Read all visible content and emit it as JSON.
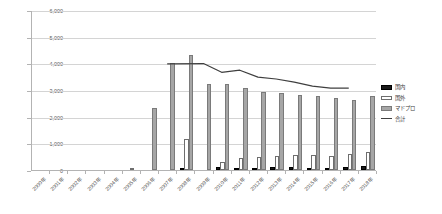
{
  "chart_data": {
    "type": "bar",
    "title": "",
    "subtitle": "",
    "xlabel": "",
    "ylabel": "",
    "ylim": [
      0,
      6000
    ],
    "ytick_step": 1000,
    "ytick_labels": [
      "6,000",
      "5,000",
      "4,000",
      "3,000",
      "2,000",
      "1,000",
      "0"
    ],
    "ytick_values": [
      6000,
      5000,
      4000,
      3000,
      2000,
      1000,
      0
    ],
    "grid": true,
    "legend_position": "right",
    "categories": [
      "2000年",
      "2001年",
      "2002年",
      "2003年",
      "2004年",
      "2005年",
      "2006年",
      "2007年",
      "2008年",
      "2009年",
      "2010年",
      "2011年",
      "2012年",
      "2013年",
      "2014年",
      "2015年",
      "2016年",
      "2017年",
      "2018年"
    ],
    "series": [
      {
        "name": "国内",
        "kind": "bar",
        "color": "#1a1a1a",
        "values": [
          0,
          0,
          0,
          0,
          0,
          0,
          0,
          0,
          90,
          0,
          95,
          85,
          90,
          95,
          95,
          90,
          90,
          100,
          150
        ]
      },
      {
        "name": "国外",
        "kind": "bar",
        "color": "#ffffff",
        "values": [
          0,
          0,
          0,
          0,
          0,
          20,
          0,
          0,
          1180,
          0,
          290,
          460,
          480,
          520,
          560,
          560,
          540,
          600,
          680
        ]
      },
      {
        "name": "マドプロ",
        "kind": "bar",
        "color": "#a6a6a6",
        "values": [
          0,
          0,
          0,
          0,
          0,
          0,
          2330,
          4030,
          4300,
          3240,
          3210,
          3060,
          2920,
          2870,
          2800,
          2760,
          2700,
          2620,
          2790
        ]
      },
      {
        "name": "合計",
        "kind": "line",
        "color": "#3f3f3f",
        "values": [
          null,
          null,
          null,
          null,
          null,
          null,
          null,
          4020,
          null,
          4030,
          3700,
          3780,
          3520,
          3450,
          3330,
          3180,
          3110,
          3110,
          null
        ]
      }
    ],
    "legend_entries": [
      {
        "label": "国内",
        "swatch": "s-domestic"
      },
      {
        "label": "国外",
        "swatch": "s-foreign"
      },
      {
        "label": "マドプロ",
        "swatch": "s-madopro"
      },
      {
        "label": "合計",
        "swatch": "s-total"
      }
    ]
  }
}
